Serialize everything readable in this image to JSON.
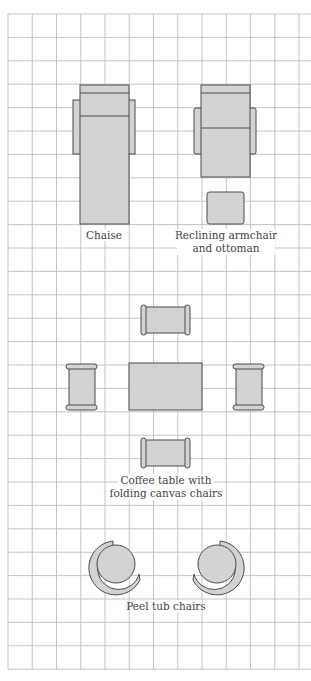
{
  "diagram": {
    "type": "furniture-floor-plan",
    "grid": {
      "columns": 12,
      "rows": 28,
      "line_color": "#bdbdbd"
    },
    "colors": {
      "furniture_fill": "#d3d3d3",
      "furniture_stroke": "#4a4a4a",
      "label_color": "#444444"
    },
    "groups": [
      {
        "id": "chaise",
        "label_lines": [
          "Chaise"
        ]
      },
      {
        "id": "recliner",
        "label_lines": [
          "Reclining armchair",
          "and ottoman"
        ]
      },
      {
        "id": "coffee-table",
        "label_lines": [
          "Coffee table with",
          "folding canvas chairs"
        ]
      },
      {
        "id": "peel-tub",
        "label_lines": [
          "Peel tub chairs"
        ]
      }
    ]
  }
}
